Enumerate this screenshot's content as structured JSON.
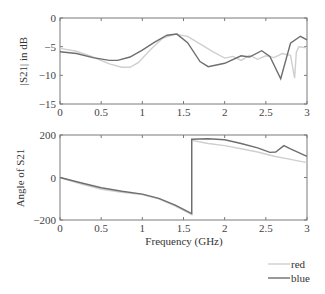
{
  "chart_data": [
    {
      "type": "line",
      "title": "",
      "xlabel": "",
      "ylabel": "|S21| in dB",
      "xlim": [
        0,
        3
      ],
      "ylim": [
        -15,
        0
      ],
      "xticks": [
        "0",
        "0.5",
        "1",
        "1.5",
        "2",
        "2.5",
        "3"
      ],
      "yticks": [
        "0",
        "-5",
        "-10",
        "-15"
      ],
      "grid": false,
      "series": [
        {
          "name": "red",
          "color": "#cfcfcf",
          "x": [
            0,
            0.2,
            0.4,
            0.6,
            0.75,
            0.85,
            0.95,
            1.1,
            1.25,
            1.4,
            1.55,
            1.7,
            1.85,
            2.0,
            2.1,
            2.2,
            2.3,
            2.4,
            2.5,
            2.6,
            2.7,
            2.8,
            2.85,
            2.87,
            2.9,
            3.0
          ],
          "values": [
            -5.3,
            -5.8,
            -6.8,
            -8.0,
            -8.6,
            -8.6,
            -7.8,
            -5.5,
            -3.5,
            -2.8,
            -3.2,
            -4.5,
            -5.8,
            -7.0,
            -6.7,
            -7.4,
            -6.5,
            -7.2,
            -6.6,
            -6.9,
            -6.2,
            -6.5,
            -10.5,
            -6.0,
            -5.0,
            -5.2
          ]
        },
        {
          "name": "blue",
          "color": "#6e6e6e",
          "x": [
            0,
            0.2,
            0.4,
            0.6,
            0.7,
            0.85,
            1.0,
            1.15,
            1.3,
            1.42,
            1.55,
            1.7,
            1.8,
            2.0,
            2.2,
            2.3,
            2.45,
            2.55,
            2.68,
            2.8,
            2.92,
            3.0
          ],
          "values": [
            -5.9,
            -6.2,
            -6.9,
            -7.4,
            -7.4,
            -6.8,
            -5.6,
            -4.2,
            -3.0,
            -2.8,
            -4.3,
            -7.6,
            -8.5,
            -7.9,
            -6.6,
            -6.8,
            -5.7,
            -6.7,
            -10.6,
            -4.4,
            -3.2,
            -3.8
          ]
        }
      ]
    },
    {
      "type": "line",
      "title": "",
      "xlabel": "Frequency (GHz)",
      "ylabel": "Angle of S21",
      "xlim": [
        0,
        3
      ],
      "ylim": [
        -200,
        200
      ],
      "xticks": [
        "0",
        "0.5",
        "1",
        "1.5",
        "2",
        "2.5",
        "3"
      ],
      "yticks": [
        "200",
        "0",
        "-200"
      ],
      "grid": false,
      "series": [
        {
          "name": "red",
          "color": "#cfcfcf",
          "x": [
            0,
            0.25,
            0.5,
            0.75,
            1.0,
            1.2,
            1.4,
            1.6,
            1.6,
            1.8,
            2.0,
            2.2,
            2.4,
            2.6,
            2.8,
            3.0
          ],
          "values": [
            0,
            -30,
            -55,
            -70,
            -80,
            -100,
            -135,
            -175,
            175,
            160,
            150,
            135,
            120,
            100,
            85,
            70
          ]
        },
        {
          "name": "blue",
          "color": "#6e6e6e",
          "x": [
            0,
            0.25,
            0.5,
            0.75,
            1.0,
            1.2,
            1.4,
            1.6,
            1.6,
            1.8,
            2.0,
            2.2,
            2.4,
            2.55,
            2.62,
            2.72,
            2.8,
            3.0
          ],
          "values": [
            0,
            -25,
            -48,
            -65,
            -78,
            -98,
            -130,
            -170,
            180,
            182,
            178,
            160,
            140,
            118,
            120,
            150,
            135,
            100
          ]
        }
      ]
    }
  ],
  "legend": {
    "position": "bottom-right",
    "entries": [
      {
        "label": "red",
        "color": "#cfcfcf"
      },
      {
        "label": "blue",
        "color": "#6e6e6e"
      }
    ]
  }
}
